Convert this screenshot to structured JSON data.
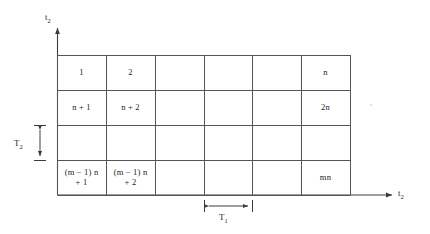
{
  "figure": {
    "background_color": "#ffffff",
    "line_color": "#4a4a4a",
    "text_color": "#1c1c1c"
  },
  "axes": {
    "vertical": {
      "label_base": "t",
      "label_sub": "2",
      "name": "t2"
    },
    "horizontal": {
      "label_base": "t",
      "label_sub": "2",
      "name": "t2"
    }
  },
  "grid": {
    "columns": 6,
    "rows": 4,
    "cells": [
      [
        "1",
        "2",
        "",
        "",
        "",
        "n"
      ],
      [
        "n + 1",
        "n + 2",
        "",
        "",
        "",
        "2n"
      ],
      [
        "",
        "",
        "",
        "",
        "",
        ""
      ],
      [
        "(m − 1) n\n+ 1",
        "(m − 1) n\n+ 2",
        "",
        "",
        "",
        "mn"
      ]
    ]
  },
  "dimensions": {
    "column_width": {
      "label_base": "T",
      "label_sub": "1",
      "name": "T1",
      "orientation": "horizontal"
    },
    "row_height": {
      "label_base": "T",
      "label_sub": "2",
      "name": "T2",
      "orientation": "vertical"
    }
  }
}
